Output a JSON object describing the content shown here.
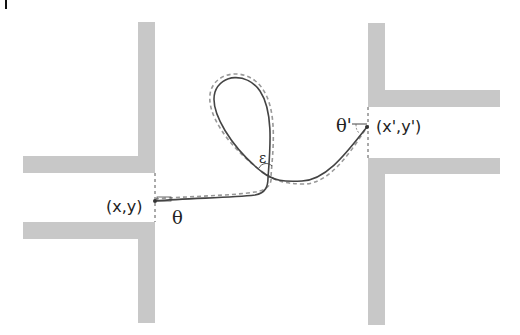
{
  "diagram": {
    "start_label": "(x,y)",
    "end_label": "(x',y')",
    "start_angle_label": "θ",
    "end_angle_label": "θ'",
    "crossing_label": "ε",
    "panel_mark": "|"
  },
  "colors": {
    "wall": "#c8c8c8",
    "path_solid": "#444444",
    "path_dashed": "#999999",
    "doorway": "#555555"
  }
}
